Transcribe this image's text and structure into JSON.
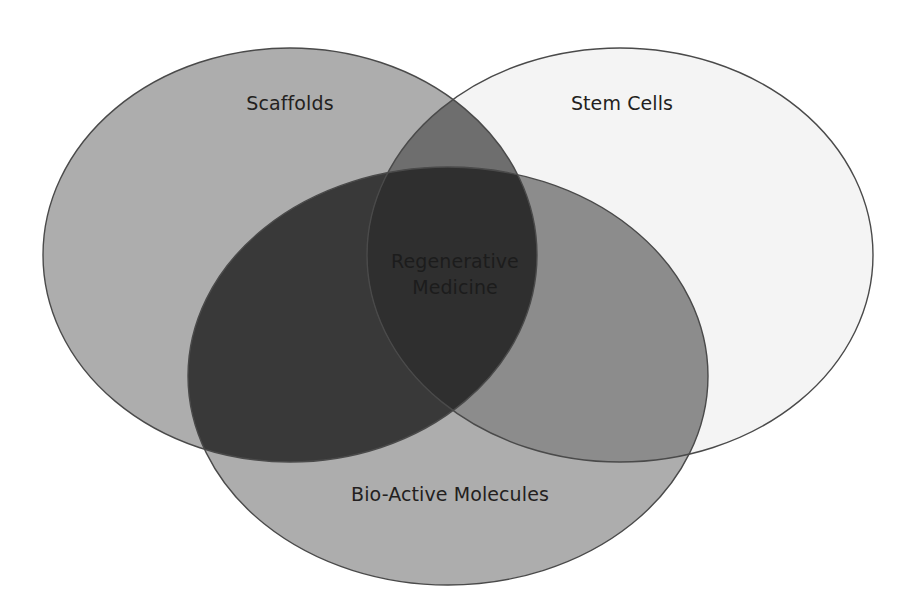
{
  "diagram": {
    "type": "venn",
    "background_color": "#ffffff",
    "outline_color": "#4a4a4a",
    "label_color": "#231f20",
    "sets": [
      {
        "id": "scaffolds",
        "label": "Scaffolds",
        "fill": "#adadad",
        "cx": 290,
        "cy": 255,
        "rx": 247,
        "ry": 207,
        "label_x": 290,
        "label_y": 110
      },
      {
        "id": "stem-cells",
        "label": "Stem Cells",
        "fill": "#f4f4f4",
        "cx": 620,
        "cy": 255,
        "rx": 253,
        "ry": 207,
        "label_x": 622,
        "label_y": 110
      },
      {
        "id": "bio-active-molecules",
        "label": "Bio-Active Molecules",
        "fill": "#adadad",
        "cx": 448,
        "cy": 376,
        "rx": 260,
        "ry": 209,
        "label_x": 450,
        "label_y": 501
      }
    ],
    "intersections": [
      {
        "id": "scaffolds-stem-cells",
        "fill": "#6e6e6e"
      },
      {
        "id": "scaffolds-bio-active",
        "fill": "#393939"
      },
      {
        "id": "stem-cells-bio-active",
        "fill": "#8c8c8c"
      },
      {
        "id": "all-three",
        "fill": "#2f2f2f",
        "label_line_1": "Regenerative",
        "label_line_2": "Medicine",
        "label_color": "#1a1a1a",
        "label_x": 455,
        "label_y": 268,
        "label_y2": 294
      }
    ],
    "ghost_artifacts": [
      {
        "id": "ghost-regenerative",
        "text": "Regenerative",
        "x": 656,
        "y": 318,
        "fill": "#efefef"
      },
      {
        "id": "ghost-medicine",
        "text": "Medicine",
        "x": 360,
        "y": 470,
        "fill": "#a2a2a2"
      }
    ]
  }
}
